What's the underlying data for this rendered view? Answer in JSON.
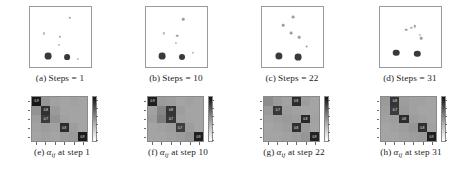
{
  "figure": {
    "type": "multi-panel-figure",
    "panels_top": [
      {
        "key": "a",
        "label": "(a)",
        "caption_prefix": "Steps",
        "equals": "=",
        "value": "1",
        "full_caption": "(a) Steps = 1",
        "points": [
          {
            "x": 30,
            "y": 82,
            "r": 3.4,
            "cls": "big"
          },
          {
            "x": 62,
            "y": 84,
            "r": 2.9,
            "cls": "big"
          },
          {
            "x": 80,
            "y": 86,
            "r": 1.1,
            "cls": "tiny"
          },
          {
            "x": 24,
            "y": 44,
            "r": 1.1,
            "cls": "tiny"
          },
          {
            "x": 50,
            "y": 50,
            "r": 1.2,
            "cls": "small"
          },
          {
            "x": 48,
            "y": 63,
            "r": 1.1,
            "cls": "tiny"
          },
          {
            "x": 66,
            "y": 18,
            "r": 1.2,
            "cls": "small"
          }
        ]
      },
      {
        "key": "b",
        "label": "(b)",
        "caption_prefix": "Steps",
        "equals": "=",
        "value": "10",
        "full_caption": "(b) Steps = 10",
        "points": [
          {
            "x": 27,
            "y": 82,
            "r": 3.4,
            "cls": "big"
          },
          {
            "x": 60,
            "y": 84,
            "r": 3.0,
            "cls": "big"
          },
          {
            "x": 78,
            "y": 76,
            "r": 1.2,
            "cls": "tiny"
          },
          {
            "x": 30,
            "y": 44,
            "r": 1.2,
            "cls": "tiny"
          },
          {
            "x": 52,
            "y": 48,
            "r": 1.3,
            "cls": "small"
          },
          {
            "x": 50,
            "y": 60,
            "r": 1.1,
            "cls": "tiny"
          },
          {
            "x": 62,
            "y": 20,
            "r": 1.3,
            "cls": "small"
          }
        ]
      },
      {
        "key": "c",
        "label": "(c)",
        "caption_prefix": "Steps",
        "equals": "=",
        "value": "22",
        "full_caption": "(c) Steps = 22",
        "points": [
          {
            "x": 28,
            "y": 81,
            "r": 3.6,
            "cls": "big"
          },
          {
            "x": 60,
            "y": 83,
            "r": 3.4,
            "cls": "big"
          },
          {
            "x": 74,
            "y": 66,
            "r": 1.4,
            "cls": "small"
          },
          {
            "x": 62,
            "y": 50,
            "r": 1.3,
            "cls": "small"
          },
          {
            "x": 48,
            "y": 44,
            "r": 1.4,
            "cls": "small"
          },
          {
            "x": 36,
            "y": 30,
            "r": 1.3,
            "cls": "small"
          },
          {
            "x": 52,
            "y": 17,
            "r": 1.4,
            "cls": "small"
          }
        ]
      },
      {
        "key": "d",
        "label": "(d)",
        "caption_prefix": "Steps",
        "equals": "=",
        "value": "31",
        "full_caption": "(d) Steps = 31",
        "points": [
          {
            "x": 27,
            "y": 76,
            "r": 3.3,
            "cls": "big"
          },
          {
            "x": 62,
            "y": 78,
            "r": 3.2,
            "cls": "big"
          },
          {
            "x": 68,
            "y": 52,
            "r": 1.3,
            "cls": "small"
          },
          {
            "x": 66,
            "y": 46,
            "r": 1.1,
            "cls": "tiny"
          },
          {
            "x": 44,
            "y": 38,
            "r": 1.3,
            "cls": "small"
          },
          {
            "x": 52,
            "y": 35,
            "r": 1.2,
            "cls": "tiny"
          },
          {
            "x": 58,
            "y": 32,
            "r": 1.2,
            "cls": "small"
          }
        ]
      }
    ],
    "panels_bottom": [
      {
        "key": "e",
        "label": "(e)",
        "symbol": "α",
        "subscript": "ij",
        "caption_mid": "at step",
        "value": "1",
        "full_caption": "(e) αij at step 1",
        "matrix": [
          [
            0.92,
            0.2,
            0.14,
            0.12,
            0.14,
            0.12
          ],
          [
            0.22,
            0.78,
            0.18,
            0.12,
            0.12,
            0.12
          ],
          [
            0.16,
            0.72,
            0.22,
            0.14,
            0.12,
            0.12
          ],
          [
            0.14,
            0.16,
            0.14,
            0.8,
            0.16,
            0.12
          ],
          [
            0.12,
            0.14,
            0.12,
            0.16,
            0.18,
            0.9
          ]
        ],
        "labels": [
          [
            "0.9",
            "",
            "",
            "",
            "",
            ""
          ],
          [
            "",
            "0.8",
            "",
            "",
            "",
            ""
          ],
          [
            "",
            "0.7",
            "",
            "",
            "",
            ""
          ],
          [
            "",
            "",
            "",
            "0.8",
            "",
            ""
          ],
          [
            "",
            "",
            "",
            "",
            "",
            "0.9"
          ]
        ]
      },
      {
        "key": "f",
        "label": "(f)",
        "symbol": "α",
        "subscript": "ij",
        "caption_mid": "at step",
        "value": "10",
        "full_caption": "(f) αij at step 10",
        "matrix": [
          [
            0.88,
            0.18,
            0.16,
            0.12,
            0.14,
            0.12
          ],
          [
            0.14,
            0.3,
            0.76,
            0.16,
            0.12,
            0.12
          ],
          [
            0.16,
            0.34,
            0.74,
            0.14,
            0.12,
            0.12
          ],
          [
            0.12,
            0.14,
            0.16,
            0.7,
            0.16,
            0.12
          ],
          [
            0.12,
            0.12,
            0.14,
            0.16,
            0.2,
            0.88
          ]
        ],
        "labels": [
          [
            "0.9",
            "",
            "",
            "",
            "",
            ""
          ],
          [
            "",
            "",
            "0.8",
            "",
            "",
            ""
          ],
          [
            "",
            "",
            "0.7",
            "",
            "",
            ""
          ],
          [
            "",
            "",
            "",
            "0.7",
            "",
            ""
          ],
          [
            "",
            "",
            "",
            "",
            "",
            "0.9"
          ]
        ]
      },
      {
        "key": "g",
        "label": "(g)",
        "symbol": "α",
        "subscript": "ij",
        "caption_mid": "at step",
        "value": "22",
        "full_caption": "(g) αij at step 22",
        "matrix": [
          [
            0.26,
            0.18,
            0.14,
            0.8,
            0.16,
            0.12
          ],
          [
            0.18,
            0.74,
            0.16,
            0.14,
            0.12,
            0.12
          ],
          [
            0.14,
            0.16,
            0.18,
            0.16,
            0.82,
            0.14
          ],
          [
            0.12,
            0.14,
            0.16,
            0.78,
            0.18,
            0.12
          ],
          [
            0.12,
            0.12,
            0.14,
            0.16,
            0.2,
            0.86
          ]
        ],
        "labels": [
          [
            "",
            "",
            "",
            "0.8",
            "",
            ""
          ],
          [
            "",
            "0.7",
            "",
            "",
            "",
            ""
          ],
          [
            "",
            "",
            "",
            "",
            "0.8",
            ""
          ],
          [
            "",
            "",
            "",
            "0.8",
            "",
            ""
          ],
          [
            "",
            "",
            "",
            "",
            "",
            "0.9"
          ]
        ]
      },
      {
        "key": "h",
        "label": "(h)",
        "symbol": "α",
        "subscript": "ij",
        "caption_mid": "at step",
        "value": "31",
        "full_caption": "(h) αij at step 31",
        "matrix": [
          [
            0.18,
            0.76,
            0.16,
            0.14,
            0.14,
            0.12
          ],
          [
            0.16,
            0.72,
            0.18,
            0.14,
            0.12,
            0.12
          ],
          [
            0.14,
            0.16,
            0.8,
            0.16,
            0.14,
            0.12
          ],
          [
            0.12,
            0.14,
            0.16,
            0.2,
            0.78,
            0.14
          ],
          [
            0.12,
            0.12,
            0.14,
            0.16,
            0.18,
            0.88
          ]
        ],
        "labels": [
          [
            "",
            "0.8",
            "",
            "",
            "",
            ""
          ],
          [
            "",
            "0.7",
            "",
            "",
            "",
            ""
          ],
          [
            "",
            "",
            "0.8",
            "",
            "",
            ""
          ],
          [
            "",
            "",
            "",
            "",
            "0.8",
            ""
          ],
          [
            "",
            "",
            "",
            "",
            "",
            "0.9"
          ]
        ]
      }
    ],
    "colorbar": {
      "ticks": [
        "",
        "",
        "",
        "",
        "",
        ""
      ],
      "orientation": "vertical",
      "low_color": "#ffffff",
      "high_color": "#101010"
    }
  },
  "chart_data": {
    "type": "heatmap",
    "title": "",
    "xlabel": "",
    "ylabel": "",
    "panel_layout": "2 rows x 4 columns",
    "top_row_type": "scatter",
    "bottom_row_type": "heatmap",
    "steps": [
      1,
      10,
      22,
      31
    ],
    "legend": [],
    "grid": false
  }
}
